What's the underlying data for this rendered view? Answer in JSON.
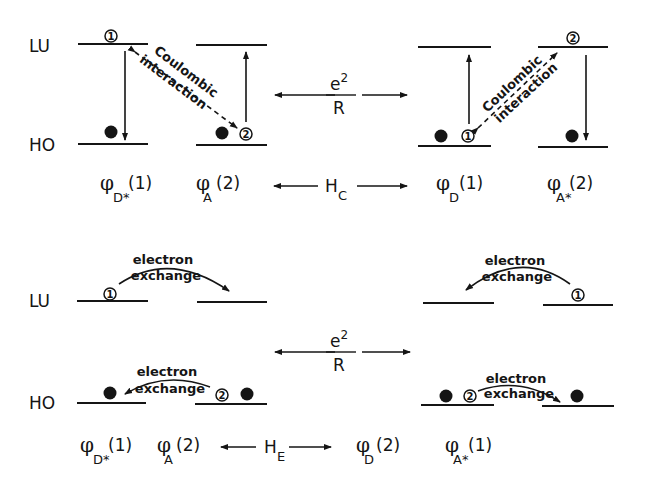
{
  "labels": {
    "lu": "LU",
    "ho": "HO",
    "coulombic_line1": "Coulombic",
    "coulombic_line2": "interaction",
    "exchange_line1": "electron",
    "exchange_line2": "exchange",
    "e2": "e",
    "e2_exp": "2",
    "R": "R"
  },
  "panels": [
    {
      "name": "coulombic",
      "operator": {
        "symbol": "H",
        "subscript": "C"
      },
      "left_states": [
        {
          "phi": "φ",
          "sub": "D*",
          "arg": "(1)"
        },
        {
          "phi": "φ",
          "sub": "A",
          "arg": "(2)"
        }
      ],
      "right_states": [
        {
          "phi": "φ",
          "sub": "D",
          "arg": "(1)"
        },
        {
          "phi": "φ",
          "sub": "A*",
          "arg": "(2)"
        }
      ]
    },
    {
      "name": "exchange",
      "operator": {
        "symbol": "H",
        "subscript": "E"
      },
      "left_states": [
        {
          "phi": "φ",
          "sub": "D*",
          "arg": "(1)"
        },
        {
          "phi": "φ",
          "sub": "A",
          "arg": "(2)"
        }
      ],
      "right_states": [
        {
          "phi": "φ",
          "sub": "D",
          "arg": "(2)"
        },
        {
          "phi": "φ",
          "sub": "A*",
          "arg": "(1)"
        }
      ]
    }
  ],
  "electron_markers": {
    "one": "1",
    "two": "2"
  }
}
